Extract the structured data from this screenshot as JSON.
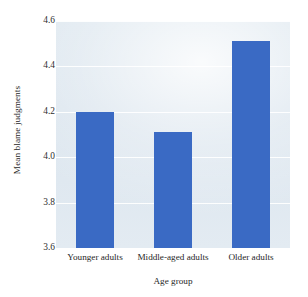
{
  "chart_data": {
    "type": "bar",
    "title": "",
    "xlabel": "Age group",
    "ylabel": "Mean blame judgments",
    "categories": [
      "Younger adults",
      "Middle-aged adults",
      "Older adults"
    ],
    "values": [
      4.2,
      4.11,
      4.51
    ],
    "ylim": [
      3.6,
      4.6
    ],
    "yticks": [
      "4.6",
      "4.4",
      "4.2",
      "4.0",
      "3.8",
      "3.6"
    ],
    "ytick_values": [
      4.6,
      4.4,
      4.2,
      4.0,
      3.8,
      3.6
    ],
    "grid": true,
    "legend": "none",
    "bar_color": "#3a6ac4",
    "plot_background": "#dee7ef",
    "gridline_color": "#ffffff"
  }
}
